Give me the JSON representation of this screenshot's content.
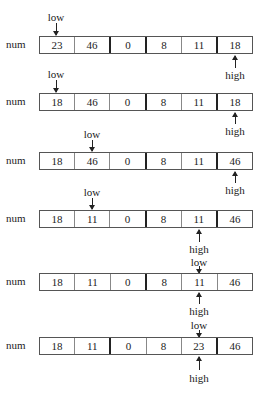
{
  "array_label": "num",
  "pointer_labels": {
    "low": "low",
    "high": "high"
  },
  "steps": [
    {
      "values": [
        "23",
        "46",
        "0",
        "8",
        "11",
        "18"
      ],
      "thick_dividers": [
        2,
        3,
        5
      ],
      "low_index": 0,
      "high_index": 5
    },
    {
      "values": [
        "18",
        "46",
        "0",
        "8",
        "11",
        "18"
      ],
      "thick_dividers": [
        3,
        5
      ],
      "low_index": 0,
      "high_index": 5
    },
    {
      "values": [
        "18",
        "46",
        "0",
        "8",
        "11",
        "46"
      ],
      "thick_dividers": [
        3,
        5
      ],
      "low_index": 1,
      "high_index": 5
    },
    {
      "values": [
        "18",
        "11",
        "0",
        "8",
        "11",
        "46"
      ],
      "thick_dividers": [
        3,
        5
      ],
      "low_index": 1,
      "high_index": 4
    },
    {
      "values": [
        "18",
        "11",
        "0",
        "8",
        "11",
        "46"
      ],
      "thick_dividers": [
        3
      ],
      "low_index": 4,
      "high_index": 4
    },
    {
      "values": [
        "18",
        "11",
        "0",
        "8",
        "23",
        "46"
      ],
      "thick_dividers": [
        2,
        5
      ],
      "low_index": 4,
      "high_index": 4
    }
  ]
}
